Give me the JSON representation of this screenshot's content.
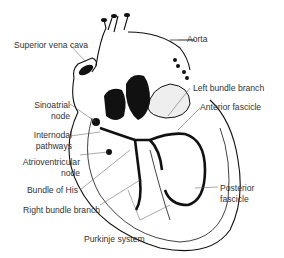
{
  "diagram": {
    "labels": {
      "superior_vena_cava": "Superior vena cava",
      "aorta": "Aorta",
      "left_bundle_branch": "Left bundle branch",
      "anterior_fascicle": "Anterior fascicle",
      "sinoatrial_node_1": "Sinoatrial",
      "sinoatrial_node_2": "node",
      "internodal_pathways_1": "Internodal",
      "internodal_pathways_2": "pathways",
      "atrioventricular_node_1": "Atrioventricular",
      "atrioventricular_node_2": "node",
      "bundle_of_his": "Bundle of His",
      "right_bundle_branch": "Right bundle branch",
      "posterior_fascicle_1": "Posterior",
      "posterior_fascicle_2": "fascicle",
      "purkinje_system": "Purkinje system"
    },
    "colors": {
      "ink": "#111111",
      "label_text": "#333333",
      "background": "#ffffff"
    }
  }
}
